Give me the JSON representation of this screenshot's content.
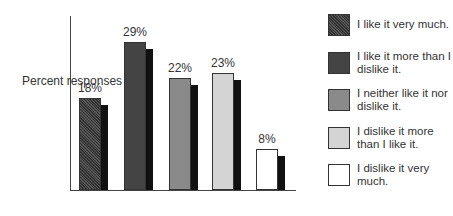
{
  "chart_data": {
    "type": "bar",
    "title": "",
    "xlabel": "",
    "ylabel": "Percent responses",
    "categories": [
      "I like it very much.",
      "I like it more than I dislike it.",
      "I neither like it nor dislike it.",
      "I dislike it more than I like it.",
      "I dislike it very much."
    ],
    "values": [
      18,
      29,
      22,
      23,
      8
    ],
    "value_labels": [
      "18%",
      "29%",
      "22%",
      "23%",
      "8%"
    ],
    "colors": [
      "#3a3a3a",
      "#444444",
      "#8a8a8a",
      "#d4d4d4",
      "#ffffff"
    ],
    "ylim": [
      0,
      30
    ],
    "grid": false,
    "legend_position": "right"
  },
  "legend": [
    {
      "label": "I like it very much."
    },
    {
      "label": "I like it more than I dislike it."
    },
    {
      "label": "I neither like it nor dislike it."
    },
    {
      "label": "I dislike it more than I like it."
    },
    {
      "label": "I dislike it very much."
    }
  ]
}
